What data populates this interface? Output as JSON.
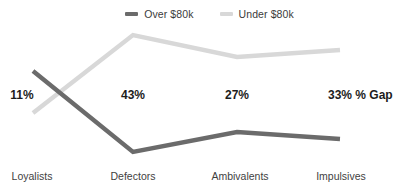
{
  "title_sliver": "",
  "legend": {
    "position": "top-center",
    "items": [
      {
        "label": "Over $80k",
        "color": "#6b6b6b",
        "icon": "line-swatch-icon"
      },
      {
        "label": "Under $80k",
        "color": "#d8d8d8",
        "icon": "line-swatch-icon"
      }
    ]
  },
  "gap_axis_label": "% Gap",
  "chart_data": {
    "type": "line",
    "title": "",
    "xlabel": "",
    "ylabel": "",
    "grid": false,
    "legend_position": "top-center",
    "categories": [
      "Loyalists",
      "Defectors",
      "Ambivalents",
      "Impulsives"
    ],
    "series": [
      {
        "name": "Over $80k",
        "color": "#6b6b6b",
        "values": [
          71,
          152,
          132,
          139
        ],
        "value_unit": "pixel-y",
        "points": [
          {
            "x": 33,
            "y": 71
          },
          {
            "x": 133,
            "y": 152
          },
          {
            "x": 237,
            "y": 132
          },
          {
            "x": 340,
            "y": 139
          }
        ]
      },
      {
        "name": "Under $80k",
        "color": "#d8d8d8",
        "values": [
          113,
          35,
          57,
          50
        ],
        "value_unit": "pixel-y",
        "points": [
          {
            "x": 33,
            "y": 113
          },
          {
            "x": 133,
            "y": 35
          },
          {
            "x": 237,
            "y": 57
          },
          {
            "x": 340,
            "y": 50
          }
        ]
      }
    ],
    "annotations": [
      {
        "category": "Loyalists",
        "text": "11%",
        "x": 22,
        "y": 95
      },
      {
        "category": "Defectors",
        "text": "43%",
        "x": 133,
        "y": 95
      },
      {
        "category": "Ambivalents",
        "text": "27%",
        "x": 237,
        "y": 95
      },
      {
        "category": "Impulsives",
        "text": "33%",
        "x": 340,
        "y": 95
      }
    ],
    "category_label_positions": [
      {
        "label": "Loyalists",
        "x": 32
      },
      {
        "label": "Defectors",
        "x": 133
      },
      {
        "label": "Ambivalents",
        "x": 240
      },
      {
        "label": "Impulsives",
        "x": 341
      }
    ]
  }
}
